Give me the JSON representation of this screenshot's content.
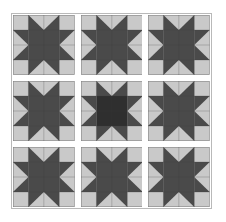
{
  "artwork": {
    "title": "Sawtooth Star Quilt Sampler",
    "pattern_name": "Sawtooth Star",
    "layout": "3x3 block grid with sashing",
    "block_rows": 3,
    "block_cols": 3,
    "block_count": 9,
    "sashing": "white strips between blocks",
    "background": "#ffffff",
    "border_color": "#b9b9b9"
  },
  "palette": {
    "light_fabric": "#c9c9c9",
    "dark_fabric": "#4a4a4a",
    "accent_dark_fabric": "#2f2f2f",
    "seam_line": "#3a3a3a",
    "sashing": "#ffffff",
    "page_background": "#ffffff"
  },
  "blocks": [
    {
      "id": "block-r1-c1",
      "row": 1,
      "col": 1,
      "name": "sawtooth-star-top-left",
      "center_color": "#4a4a4a",
      "point_color": "#4a4a4a",
      "background_color": "#c9c9c9"
    },
    {
      "id": "block-r1-c2",
      "row": 1,
      "col": 2,
      "name": "sawtooth-star-top-center",
      "center_color": "#4a4a4a",
      "point_color": "#4a4a4a",
      "background_color": "#c9c9c9"
    },
    {
      "id": "block-r1-c3",
      "row": 1,
      "col": 3,
      "name": "sawtooth-star-top-right",
      "center_color": "#4a4a4a",
      "point_color": "#4a4a4a",
      "background_color": "#c9c9c9"
    },
    {
      "id": "block-r2-c1",
      "row": 2,
      "col": 1,
      "name": "sawtooth-star-middle-left",
      "center_color": "#4a4a4a",
      "point_color": "#4a4a4a",
      "background_color": "#c9c9c9"
    },
    {
      "id": "block-r2-c2",
      "row": 2,
      "col": 2,
      "name": "sawtooth-star-middle-center",
      "center_color": "#2f2f2f",
      "point_color": "#4a4a4a",
      "background_color": "#c9c9c9"
    },
    {
      "id": "block-r2-c3",
      "row": 2,
      "col": 3,
      "name": "sawtooth-star-middle-right",
      "center_color": "#4a4a4a",
      "point_color": "#4a4a4a",
      "background_color": "#c9c9c9"
    },
    {
      "id": "block-r3-c1",
      "row": 3,
      "col": 1,
      "name": "sawtooth-star-bottom-left",
      "center_color": "#4a4a4a",
      "point_color": "#4a4a4a",
      "background_color": "#c9c9c9"
    },
    {
      "id": "block-r3-c2",
      "row": 3,
      "col": 2,
      "name": "sawtooth-star-bottom-center",
      "center_color": "#4a4a4a",
      "point_color": "#4a4a4a",
      "background_color": "#c9c9c9"
    },
    {
      "id": "block-r3-c3",
      "row": 3,
      "col": 3,
      "name": "sawtooth-star-bottom-right",
      "center_color": "#4a4a4a",
      "point_color": "#4a4a4a",
      "background_color": "#c9c9c9"
    }
  ]
}
